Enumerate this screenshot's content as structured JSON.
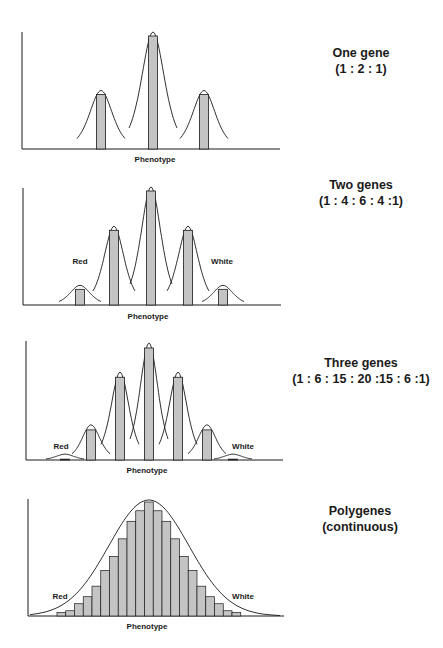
{
  "colors": {
    "bar_fill": "#c4c4c4",
    "line": "#1a1a1a",
    "background": "#ffffff"
  },
  "chart_data": [
    {
      "type": "bar",
      "title": "One gene",
      "subtitle": "(1 : 2 : 1)",
      "xlabel": "Phenotype",
      "ylabel": "",
      "categories": [
        "1",
        "2",
        "3"
      ],
      "values": [
        1,
        2,
        1
      ],
      "annotations": [],
      "overlay": "normal curve around each class",
      "grid": false
    },
    {
      "type": "bar",
      "title": "Two genes",
      "subtitle": "(1 : 4 : 6 : 4 :1)",
      "xlabel": "Phenotype",
      "ylabel": "",
      "categories": [
        "1",
        "2",
        "3",
        "4",
        "5"
      ],
      "values": [
        1,
        4,
        6,
        4,
        1
      ],
      "annotations": [
        "Red",
        "White"
      ],
      "overlay": "normal curve around each class",
      "grid": false
    },
    {
      "type": "bar",
      "title": "Three genes",
      "subtitle": "(1 : 6 : 15 : 20 :15 : 6 :1)",
      "xlabel": "Phenotype",
      "ylabel": "",
      "categories": [
        "1",
        "2",
        "3",
        "4",
        "5",
        "6",
        "7"
      ],
      "values": [
        1,
        6,
        15,
        20,
        15,
        6,
        1
      ],
      "annotations": [
        "Red",
        "White"
      ],
      "overlay": "normal curve around each class",
      "grid": false
    },
    {
      "type": "bar",
      "title": "Polygenes",
      "subtitle": "(continuous)",
      "xlabel": "Phenotype",
      "ylabel": "",
      "categories": [
        "1",
        "2",
        "3",
        "4",
        "5",
        "6",
        "7",
        "8",
        "9",
        "10",
        "11",
        "12",
        "13",
        "14",
        "15",
        "16",
        "17",
        "18",
        "19",
        "20",
        "21"
      ],
      "values": [
        2,
        3,
        7,
        11,
        17,
        26,
        34,
        44,
        54,
        60,
        65,
        60,
        54,
        44,
        34,
        26,
        17,
        11,
        7,
        3,
        2
      ],
      "annotations": [
        "Red",
        "White"
      ],
      "overlay": "single continuous normal curve",
      "grid": false
    }
  ],
  "panels": [
    {
      "title": "One gene",
      "ratio": "(1 : 2 : 1)",
      "xlabel": "Phenotype"
    },
    {
      "title": "Two genes",
      "ratio": "(1 : 4 : 6 : 4 :1)",
      "xlabel": "Phenotype",
      "left_label": "Red",
      "right_label": "White"
    },
    {
      "title": "Three genes",
      "ratio": "(1 : 6 : 15 : 20 :15 : 6 :1)",
      "xlabel": "Phenotype",
      "left_label": "Red",
      "right_label": "White"
    },
    {
      "title": "Polygenes",
      "ratio": "(continuous)",
      "xlabel": "Phenotype",
      "left_label": "Red",
      "right_label": "White"
    }
  ]
}
